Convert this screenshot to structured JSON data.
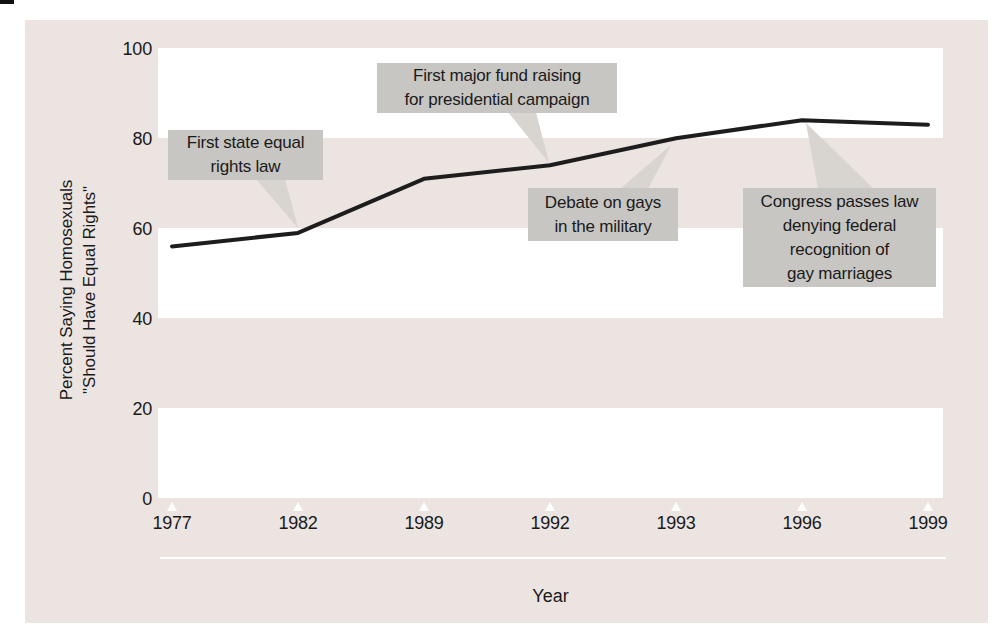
{
  "colors": {
    "panel": "#EBE4E1",
    "band": "#FFFFFF",
    "box": "#C8C6C3",
    "wedge": "#D8D5D1",
    "line": "#1D1D1D",
    "text": "#1A1A1A"
  },
  "chart_data": {
    "type": "line",
    "title": "",
    "xlabel": "Year",
    "ylabel_lines": [
      "Percent Saying Homosexuals",
      "\"Should Have Equal Rights\""
    ],
    "categories": [
      "1977",
      "1982",
      "1989",
      "1992",
      "1993",
      "1996",
      "1999"
    ],
    "series": [
      {
        "name": "Percent saying homosexuals should have equal rights",
        "values": [
          56,
          59,
          71,
          74,
          80,
          84,
          83
        ]
      }
    ],
    "ylim": [
      0,
      100
    ],
    "yticks": [
      100,
      80,
      60,
      40,
      20,
      0
    ],
    "ytick_labels": [
      "100",
      "80",
      "60",
      "40",
      "20",
      "0"
    ],
    "grid": "alternating white horizontal bands (100-80, 60-40, 20-0) on pink background",
    "legend": "none",
    "annotations": [
      {
        "target_year": "1982",
        "text_lines": [
          "First state equal",
          "rights law"
        ]
      },
      {
        "target_year": "1992",
        "text_lines": [
          "First major fund raising",
          "for presidential campaign"
        ]
      },
      {
        "target_year": "1993",
        "text_lines": [
          "Debate on gays",
          "in the military"
        ]
      },
      {
        "target_year": "1996",
        "text_lines": [
          "Congress passes law",
          "denying federal",
          "recognition of",
          "gay marriages"
        ]
      }
    ]
  }
}
